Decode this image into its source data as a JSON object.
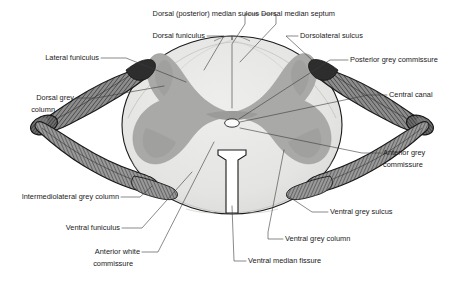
{
  "figure": {
    "background_color": "#ffffff"
  },
  "colors": {
    "white_matter": "#e4e4e2",
    "white_matter_light": "#ececeb",
    "grey_matter": "#a9a9a7",
    "grey_matter_dark": "#9a9a98",
    "outline": "#1a1a1a",
    "root_dark": "#3d3d3d",
    "root_mid": "#7a7a7a",
    "root_light": "#b5b5b5",
    "central_canal": "#fbfbfb",
    "leader_line": "#3a3a3a",
    "text": "#1a1a1a"
  },
  "labels": [
    {
      "id": "dorsal-posterior-median-sulcus",
      "text": "Dorsal (posterior) median sulcus",
      "align": "end",
      "x": 259,
      "y": 14
    },
    {
      "id": "dorsal-median-septum",
      "text": "Dorsal median septum",
      "align": "start",
      "x": 261,
      "y": 14
    },
    {
      "id": "dorsal-funiculus",
      "text": "Dorsal funiculus",
      "align": "end",
      "x": 205,
      "y": 36
    },
    {
      "id": "dorsolateral-sulcus",
      "text": "Dorsolateral sulcus",
      "align": "start",
      "x": 300,
      "y": 36
    },
    {
      "id": "lateral-funiculus",
      "text": "Lateral funiculus",
      "align": "end",
      "x": 99,
      "y": 58
    },
    {
      "id": "posterior-grey-commissure",
      "text": "Posterior grey commissure",
      "align": "start",
      "x": 350,
      "y": 60
    },
    {
      "id": "dorsal-grey-column-line1",
      "text": "Dorsal grey",
      "align": "end",
      "x": 74,
      "y": 98
    },
    {
      "id": "dorsal-grey-column-line2",
      "text": "column",
      "align": "end",
      "x": 55,
      "y": 110
    },
    {
      "id": "central-canal",
      "text": "Central canal",
      "align": "start",
      "x": 389,
      "y": 95
    },
    {
      "id": "anterior-grey-commissure-line1",
      "text": "Anterior grey",
      "align": "start",
      "x": 383,
      "y": 153
    },
    {
      "id": "anterior-grey-commissure-line2",
      "text": "commissure",
      "align": "start",
      "x": 383,
      "y": 165
    },
    {
      "id": "intermediolateral-grey-column",
      "text": "Intermediolateral grey column",
      "align": "end",
      "x": 119,
      "y": 197
    },
    {
      "id": "ventral-grey-sulcus",
      "text": "Ventral grey sulcus",
      "align": "start",
      "x": 330,
      "y": 212
    },
    {
      "id": "ventral-funiculus",
      "text": "Ventral funiculus",
      "align": "end",
      "x": 120,
      "y": 228
    },
    {
      "id": "ventral-grey-column",
      "text": "Ventral grey column",
      "align": "start",
      "x": 285,
      "y": 239
    },
    {
      "id": "anterior-white-commissure-line1",
      "text": "Anterior white",
      "align": "end",
      "x": 140,
      "y": 252
    },
    {
      "id": "anterior-white-commissure-line2",
      "text": "commissure",
      "align": "end",
      "x": 133,
      "y": 264
    },
    {
      "id": "ventral-median-fissure",
      "text": "Ventral median fissure",
      "align": "start",
      "x": 248,
      "y": 261
    }
  ],
  "structures": [
    {
      "id": "white-matter-ellipse",
      "name": "White matter"
    },
    {
      "id": "grey-matter-butterfly",
      "name": "Grey matter"
    },
    {
      "id": "central-canal-lumen",
      "name": "Central canal"
    },
    {
      "id": "ventral-median-fissure-cleft",
      "name": "Ventral median fissure"
    },
    {
      "id": "dorsal-median-sulcus-notch",
      "name": "Dorsal median sulcus"
    },
    {
      "id": "left-dorsal-root",
      "name": "Left dorsal root"
    },
    {
      "id": "left-ventral-root",
      "name": "Left ventral root"
    },
    {
      "id": "right-dorsal-root",
      "name": "Right dorsal root"
    },
    {
      "id": "right-ventral-root",
      "name": "Right ventral root"
    },
    {
      "id": "left-dorsal-root-ganglion",
      "name": "Left dorsal root ganglion"
    },
    {
      "id": "right-dorsal-root-ganglion",
      "name": "Right dorsal root ganglion"
    }
  ]
}
